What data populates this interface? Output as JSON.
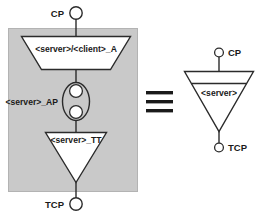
{
  "diagram": {
    "title_present": false,
    "colors": {
      "panel_fill": "#c9c9c9",
      "shape_fill": "#ffffff",
      "stroke": "#2b2b2b",
      "text": "#1a1a1a",
      "background": "#ffffff"
    },
    "left_group": {
      "top_port": {
        "label": "CP",
        "shape": "circle"
      },
      "bottom_port": {
        "label": "TCP",
        "shape": "circle"
      },
      "nodes": [
        {
          "id": "node-a",
          "label": "<server>/<client>_A",
          "shape": "trapezoid"
        },
        {
          "id": "node-ap",
          "label": "<server>_AP",
          "shape": "ellipse-with-two-circles"
        },
        {
          "id": "node-tt",
          "label": "<server>_TT",
          "shape": "triangle-down"
        }
      ]
    },
    "equivalence": {
      "symbol": "≡",
      "name": "equivalent-to"
    },
    "right_group": {
      "top_port": {
        "label": "CP",
        "shape": "circle"
      },
      "bottom_port": {
        "label": "TCP",
        "shape": "circle"
      },
      "node": {
        "id": "node-server",
        "label": "<server>",
        "shape": "triangle-down-with-divider"
      }
    }
  }
}
